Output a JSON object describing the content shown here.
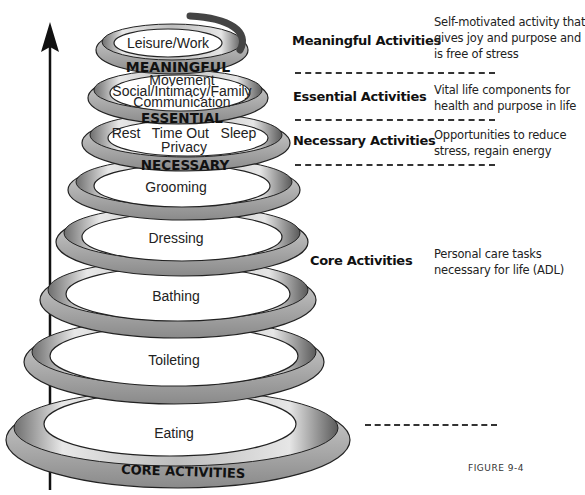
{
  "diagram": {
    "rings": [
      {
        "label": "Leisure/Work"
      },
      {
        "lines": [
          "Movement",
          "Social/Intimacy/Family",
          "Communication"
        ]
      },
      {
        "lines": [
          "Rest   Time Out   Sleep",
          "Privacy"
        ]
      },
      {
        "label": "Grooming"
      },
      {
        "label": "Dressing"
      },
      {
        "label": "Bathing"
      },
      {
        "label": "Toileting"
      },
      {
        "label": "Eating"
      }
    ],
    "band_labels": {
      "meaningful": "MEANINGFUL",
      "essential": "ESSENTIAL",
      "necessary": "NECESSARY",
      "core": "CORE ACTIVITIES"
    },
    "arrow": "up-arrow"
  },
  "legend": [
    {
      "title": "Meaningful Activities",
      "description": [
        "Self-motivated activity that",
        "gives joy and purpose and",
        "is free of stress"
      ]
    },
    {
      "title": "Essential Activities",
      "description": [
        "Vital life components for",
        "health and purpose in life"
      ]
    },
    {
      "title": "Necessary Activities",
      "description": [
        "Opportunities to reduce",
        "stress, regain energy"
      ]
    },
    {
      "title": "Core Activities",
      "description": [
        "Personal care tasks",
        "necessary for life (ADL)"
      ]
    }
  ],
  "caption": "FIGURE 9-4"
}
